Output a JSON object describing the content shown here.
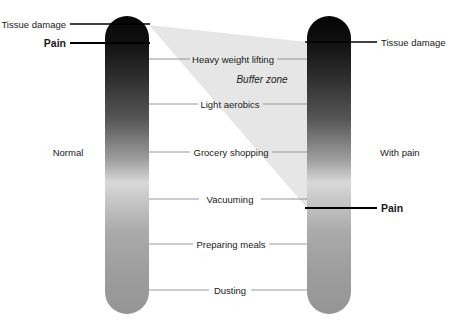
{
  "diagram": {
    "title_visible": false,
    "background_color": "#ffffff",
    "bars": [
      {
        "id": "normal-bar",
        "label": "Normal",
        "label_x": 68,
        "label_y": 152,
        "x": 105,
        "y": 16,
        "width": 44,
        "height": 298,
        "gradient_top_color": "#0d0d0d",
        "gradient_mid_color": "#d8d8d8",
        "gradient_bottom_color": "#9a9a9a",
        "markers": [
          {
            "id": "normal-tissue-damage",
            "label": "Tissue damage",
            "y": 24,
            "bold": false,
            "side": "left",
            "label_x": 66,
            "leader_x1": 70,
            "leader_x2": 150
          },
          {
            "id": "normal-pain",
            "label": "Pain",
            "y": 43,
            "bold": true,
            "side": "left",
            "label_x": 66,
            "leader_x1": 70,
            "leader_x2": 150
          }
        ]
      },
      {
        "id": "with-pain-bar",
        "label": "With pain",
        "label_x": 380,
        "label_y": 152,
        "x": 307,
        "y": 16,
        "width": 44,
        "height": 298,
        "gradient_top_color": "#0d0d0d",
        "gradient_mid_color": "#d8d8d8",
        "gradient_bottom_color": "#9a9a9a",
        "markers": [
          {
            "id": "withpain-tissue-damage",
            "label": "Tissue damage",
            "y": 42,
            "bold": false,
            "side": "right",
            "label_x": 381,
            "leader_x1": 305,
            "leader_x2": 377
          },
          {
            "id": "withpain-pain",
            "label": "Pain",
            "y": 208,
            "bold": true,
            "side": "right",
            "label_x": 381,
            "leader_x1": 305,
            "leader_x2": 377
          }
        ]
      }
    ],
    "buffer_zone": {
      "label": "Buffer zone",
      "label_x": 262,
      "label_y": 80,
      "fill_color": "#e6e6e6",
      "points": "149,25 307,42 307,208"
    },
    "activities": [
      {
        "id": "heavy-weight-lifting",
        "label": "Heavy weight lifting",
        "y": 59
      },
      {
        "id": "light-aerobics",
        "label": "Light aerobics",
        "y": 104
      },
      {
        "id": "grocery-shopping",
        "label": "Grocery shopping",
        "y": 152
      },
      {
        "id": "vacuuming",
        "label": "Vacuuming",
        "y": 199
      },
      {
        "id": "preparing-meals",
        "label": "Preparing meals",
        "y": 244
      },
      {
        "id": "dusting",
        "label": "Dusting",
        "y": 290
      }
    ],
    "colors": {
      "leader_line": "#8c8c8c",
      "marker_line": "#000000",
      "text": "#1a1a1a",
      "buffer_fill": "#e6e6e6"
    }
  }
}
